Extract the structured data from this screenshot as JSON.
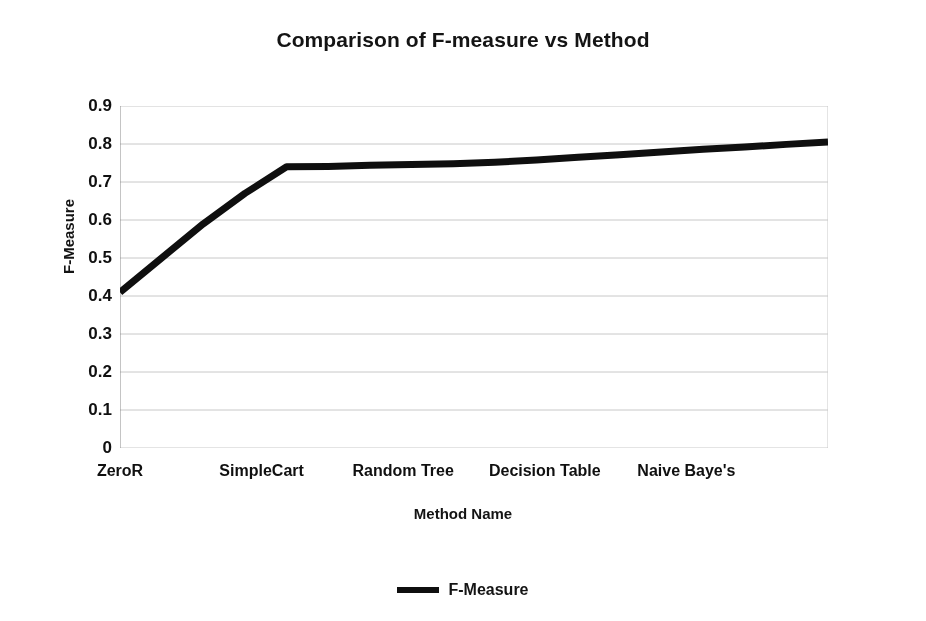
{
  "chart_data": {
    "type": "line",
    "title": "Comparison of F-measure vs Method",
    "xlabel": "Method Name",
    "ylabel": "F-Measure",
    "ylim": [
      0,
      0.9
    ],
    "y_ticks": [
      "0",
      "0.1",
      "0.2",
      "0.3",
      "0.4",
      "0.5",
      "0.6",
      "0.7",
      "0.8",
      "0.9"
    ],
    "y_tick_values": [
      0,
      0.1,
      0.2,
      0.3,
      0.4,
      0.5,
      0.6,
      0.7,
      0.8,
      0.9
    ],
    "categories": [
      "ZeroR",
      "SimpleCart",
      "Random Tree",
      "Decision Table",
      "Naive Baye's"
    ],
    "grid": true,
    "legend_position": "bottom",
    "series": [
      {
        "name": "F-Measure",
        "color": "#111111",
        "x": [
          0,
          1,
          2,
          3,
          4,
          5,
          6,
          7,
          8,
          9,
          10,
          11,
          12,
          13,
          14,
          15,
          16,
          17
        ],
        "values": [
          0.41,
          0.5,
          0.59,
          0.67,
          0.74,
          0.741,
          0.744,
          0.746,
          0.748,
          0.752,
          0.758,
          0.765,
          0.772,
          0.779,
          0.786,
          0.792,
          0.799,
          0.805
        ]
      }
    ],
    "notes": {
      "start_value": 0.41,
      "knee_value": 0.74,
      "knee_category": "SimpleCart",
      "end_value": 0.805,
      "end_category": "Naive Baye's"
    }
  },
  "legend": {
    "entries": [
      {
        "label": "F-Measure",
        "swatch": "line-swatch"
      }
    ]
  }
}
